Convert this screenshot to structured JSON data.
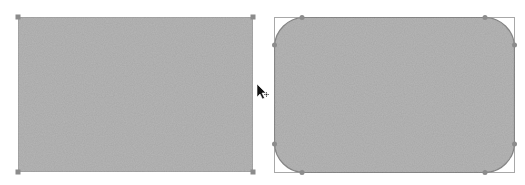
{
  "canvas": {
    "background": "#ffffff",
    "shape_fill": "#b4b4b4",
    "shape_stroke": "#9a9a9a",
    "handle_color": "#8c8c8c",
    "bbox_color": "#a8a8a8"
  },
  "shapes": [
    {
      "name": "rectangle",
      "type": "rect",
      "x": 18,
      "y": 17,
      "width": 235,
      "height": 155,
      "corner_radius": 0,
      "selected": true
    },
    {
      "name": "rounded-rectangle",
      "type": "rounded-rect",
      "x": 274,
      "y": 17,
      "width": 240,
      "height": 155,
      "corner_radius": 30,
      "selected": true
    }
  ],
  "cursor": {
    "type": "arrow-with-move",
    "x": 257,
    "y": 84
  }
}
